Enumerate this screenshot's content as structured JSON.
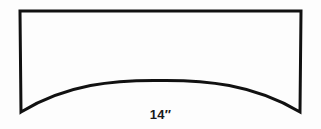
{
  "figure": {
    "background_color": "#fdfdfd",
    "stroke_color": "#111111",
    "stroke_width": 3,
    "shape": {
      "name": "valance-outline",
      "description": "Rectangle with straight top edge, straight vertical sides, and a concave upward-arching bottom edge",
      "top_left": [
        20,
        11
      ],
      "top_right": [
        301,
        11
      ],
      "bottom_right": [
        300,
        112
      ],
      "bottom_left": [
        21,
        112
      ],
      "arch_apex": [
        160,
        81
      ],
      "path": "M 20 11 L 301 11 L 300 112 C 253 84 205 80 160 80.5 C 114 80 67 84 21 112 Z"
    },
    "labels": {
      "width_dimension": "14″"
    }
  }
}
